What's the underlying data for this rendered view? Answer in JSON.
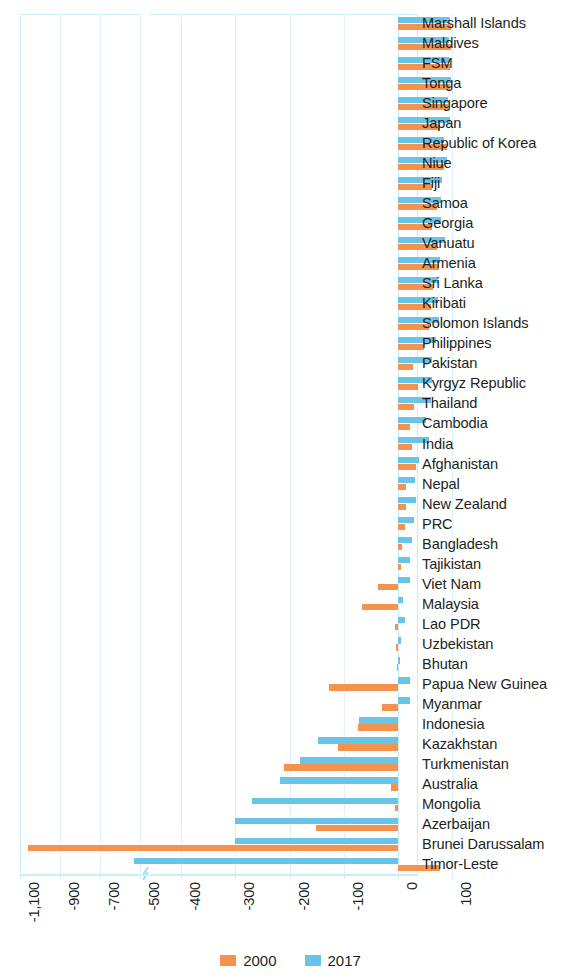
{
  "chart_data": {
    "type": "bar",
    "orientation": "horizontal",
    "title": "",
    "subtitle": "",
    "xlabel": "",
    "ylabel": "",
    "grid": true,
    "legend_position": "bottom",
    "axis_break": {
      "present": true,
      "between": [
        -500,
        -400
      ],
      "note": "x-axis is broken between the -500 and -400 ticks"
    },
    "xticks": [
      -1100,
      -900,
      -700,
      -500,
      -400,
      -300,
      -200,
      -100,
      0,
      100
    ],
    "xtick_labels": [
      "-1,100",
      "-900",
      "-700",
      "-500",
      "-400",
      "-300",
      "-200",
      "-100",
      "0",
      "100"
    ],
    "xlim": [
      -1150,
      100
    ],
    "categories": [
      "Marshall Islands",
      "Maldives",
      "FSM",
      "Tonga",
      "Singapore",
      "Japan",
      "Republic of Korea",
      "Niue",
      "Fiji",
      "Samoa",
      "Georgia",
      "Vanuatu",
      "Armenia",
      "Sri Lanka",
      "Kiribati",
      "Solomon Islands",
      "Philippines",
      "Pakistan",
      "Kyrgyz Republic",
      "Thailand",
      "Cambodia",
      "India",
      "Afghanistan",
      "Nepal",
      "New Zealand",
      "PRC",
      "Bangladesh",
      "Tajikistan",
      "Viet Nam",
      "Malaysia",
      "Lao PDR",
      "Uzbekistan",
      "Bhutan",
      "Papua New Guinea",
      "Myanmar",
      "Indonesia",
      "Kazakhstan",
      "Turkmenistan",
      "Australia",
      "Mongolia",
      "Azerbaijan",
      "Brunei Darussalam",
      "Timor-Leste"
    ],
    "series": [
      {
        "name": "2000",
        "color": "#f5924e",
        "values": [
          98,
          98,
          96,
          96,
          92,
          78,
          90,
          84,
          62,
          72,
          62,
          72,
          76,
          64,
          60,
          58,
          48,
          28,
          36,
          30,
          22,
          26,
          34,
          14,
          14,
          12,
          8,
          6,
          -36,
          -66,
          -6,
          -3,
          -2,
          -128,
          -30,
          -74,
          -110,
          -210,
          -12,
          -6,
          -152,
          -1058,
          77
        ]
      },
      {
        "name": "2017",
        "color": "#68c5e8",
        "values": [
          96,
          94,
          94,
          98,
          92,
          96,
          84,
          90,
          82,
          80,
          80,
          86,
          78,
          74,
          74,
          76,
          70,
          62,
          62,
          60,
          52,
          58,
          38,
          32,
          34,
          30,
          26,
          22,
          22,
          10,
          12,
          6,
          4,
          22,
          22,
          -72,
          -148,
          -180,
          -218,
          -270,
          -300,
          -300,
          -530
        ]
      }
    ]
  },
  "legend": {
    "items": [
      {
        "label": "2000",
        "color": "#f5924e",
        "swatch": "legend-swatch-2000"
      },
      {
        "label": "2017",
        "color": "#68c5e8",
        "swatch": "legend-swatch-2017"
      }
    ]
  },
  "colors": {
    "series_2000": "#f5924e",
    "series_2017": "#68c5e8",
    "grid": "#ddf2fa",
    "axis": "#c9eef8",
    "text": "#231f20"
  }
}
